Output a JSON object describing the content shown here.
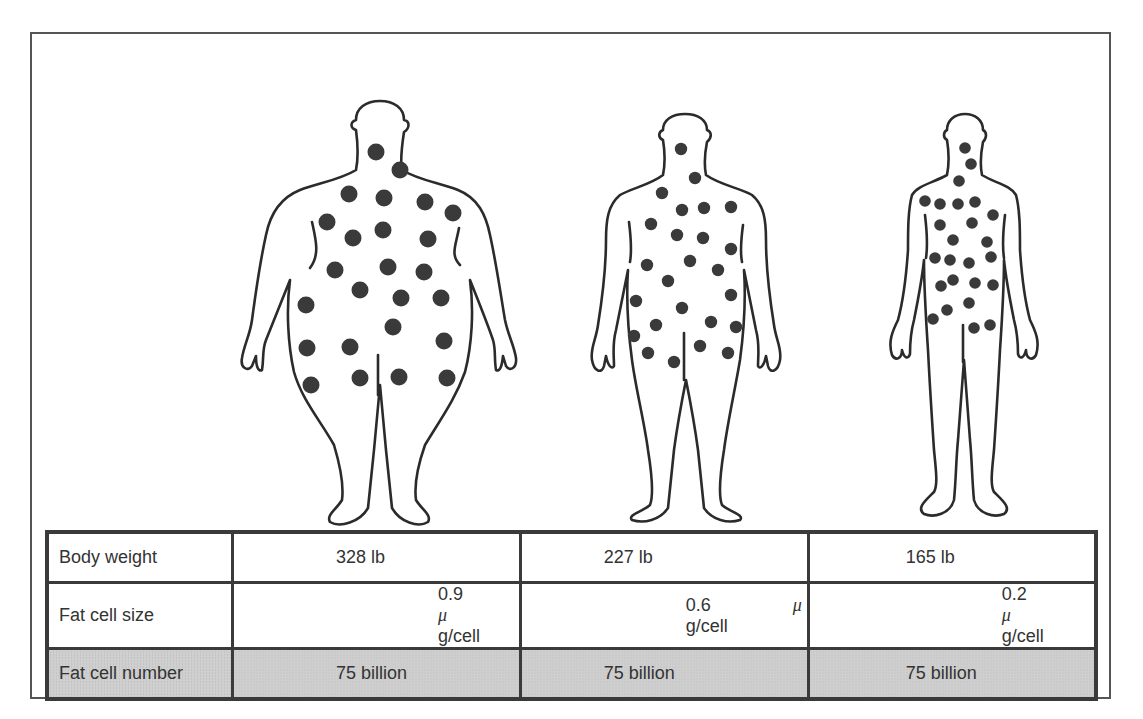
{
  "figure": {
    "colors": {
      "outline": "#2b2b2b",
      "dot": "#3a3a3a",
      "frame": "#555555",
      "table_border": "#3a3a3a",
      "shaded_row": "#cfcfcf"
    },
    "subjects": [
      {
        "id": "obese-328",
        "dots": [
          [
            376,
            152
          ],
          [
            400,
            170
          ],
          [
            349,
            194
          ],
          [
            384,
            198
          ],
          [
            425,
            202
          ],
          [
            453,
            213
          ],
          [
            327,
            222
          ],
          [
            353,
            238
          ],
          [
            383,
            230
          ],
          [
            428,
            239
          ],
          [
            335,
            270
          ],
          [
            388,
            267
          ],
          [
            424,
            272
          ],
          [
            360,
            290
          ],
          [
            401,
            298
          ],
          [
            441,
            298
          ],
          [
            306,
            305
          ],
          [
            393,
            327
          ],
          [
            444,
            341
          ],
          [
            307,
            348
          ],
          [
            350,
            347
          ],
          [
            311,
            385
          ],
          [
            360,
            378
          ],
          [
            399,
            377
          ],
          [
            447,
            378
          ]
        ]
      },
      {
        "id": "overweight-227",
        "dots": [
          [
            681,
            149
          ],
          [
            695,
            178
          ],
          [
            662,
            193
          ],
          [
            682,
            210
          ],
          [
            704,
            208
          ],
          [
            731,
            207
          ],
          [
            651,
            224
          ],
          [
            677,
            235
          ],
          [
            703,
            238
          ],
          [
            731,
            249
          ],
          [
            647,
            265
          ],
          [
            690,
            261
          ],
          [
            718,
            270
          ],
          [
            668,
            281
          ],
          [
            731,
            295
          ],
          [
            636,
            301
          ],
          [
            682,
            308
          ],
          [
            656,
            325
          ],
          [
            711,
            322
          ],
          [
            736,
            327
          ],
          [
            634,
            336
          ],
          [
            648,
            353
          ],
          [
            674,
            362
          ],
          [
            700,
            346
          ],
          [
            728,
            353
          ]
        ]
      },
      {
        "id": "lean-165",
        "dots": [
          [
            965,
            148
          ],
          [
            971,
            164
          ],
          [
            959,
            181
          ],
          [
            925,
            201
          ],
          [
            940,
            204
          ],
          [
            958,
            204
          ],
          [
            975,
            202
          ],
          [
            993,
            215
          ],
          [
            940,
            225
          ],
          [
            972,
            223
          ],
          [
            953,
            240
          ],
          [
            987,
            242
          ],
          [
            935,
            258
          ],
          [
            950,
            260
          ],
          [
            969,
            263
          ],
          [
            991,
            257
          ],
          [
            941,
            286
          ],
          [
            953,
            280
          ],
          [
            975,
            283
          ],
          [
            993,
            285
          ],
          [
            969,
            303
          ],
          [
            947,
            310
          ],
          [
            933,
            319
          ],
          [
            974,
            328
          ],
          [
            990,
            325
          ]
        ]
      }
    ]
  },
  "table": {
    "rows": [
      {
        "label": "Body weight",
        "values": [
          "328 lb",
          "227 lb",
          "165 lb"
        ],
        "shaded": false
      },
      {
        "label": "Fat cell size",
        "values": [
          {
            "num": "0.9 ",
            "unit_prefix": "μ",
            "unit_rest": "g/cell"
          },
          {
            "num": "0.6 ",
            "unit_prefix": "μ",
            "unit_rest": "g/cell"
          },
          {
            "num": "0.2 ",
            "unit_prefix": "μ",
            "unit_rest": "g/cell"
          }
        ],
        "shaded": false
      },
      {
        "label": "Fat cell number",
        "values": [
          "75 billion",
          "75 billion",
          "75 billion"
        ],
        "shaded": true
      }
    ]
  }
}
